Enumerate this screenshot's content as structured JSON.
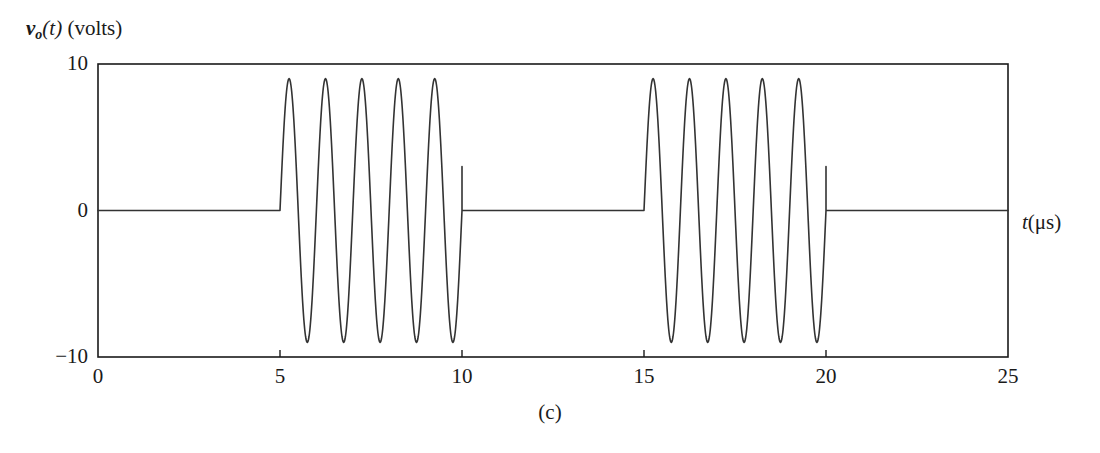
{
  "figure": {
    "caption": "(c)",
    "ylabel_var": "v",
    "ylabel_sub": "o",
    "ylabel_arg": "(t)",
    "ylabel_units": "(volts)",
    "xlabel_var": "t",
    "xlabel_units": "(μs)",
    "line_color": "#333333",
    "axis_color": "#1a1a1a"
  },
  "chart_data": {
    "type": "line",
    "title": "(c)",
    "xlabel": "t(μs)",
    "ylabel": "v_o(t) (volts)",
    "xlim": [
      0,
      25
    ],
    "ylim": [
      -10,
      10
    ],
    "xticks": [
      0,
      5,
      10,
      15,
      20,
      25
    ],
    "xticklabels": [
      "0",
      "5",
      "10",
      "15",
      "20",
      "25"
    ],
    "yticks": [
      -10,
      0,
      10
    ],
    "yticklabels": [
      "-10",
      "0",
      "10"
    ],
    "grid": false,
    "legend": null,
    "frame": "box",
    "series": [
      {
        "name": "v_o(t)",
        "segments": [
          {
            "kind": "flat",
            "t_start": 0,
            "t_end": 5,
            "value": 0
          },
          {
            "kind": "burst",
            "t_start": 5,
            "t_end": 10,
            "amplitude": 9,
            "cycles": 5,
            "period": 1,
            "phase": "sine-positive-first",
            "tail_value": 3
          },
          {
            "kind": "flat",
            "t_start": 10,
            "t_end": 15,
            "value": 0
          },
          {
            "kind": "burst",
            "t_start": 15,
            "t_end": 20,
            "amplitude": 9,
            "cycles": 5,
            "period": 1,
            "phase": "sine-positive-first",
            "tail_value": 3
          },
          {
            "kind": "flat",
            "t_start": 20,
            "t_end": 25,
            "value": 0
          }
        ]
      }
    ]
  },
  "geometry": {
    "plot_left_px": 98,
    "plot_right_px": 1008,
    "plot_top_px": 64,
    "plot_bottom_px": 357,
    "zero_y_px": 224
  }
}
